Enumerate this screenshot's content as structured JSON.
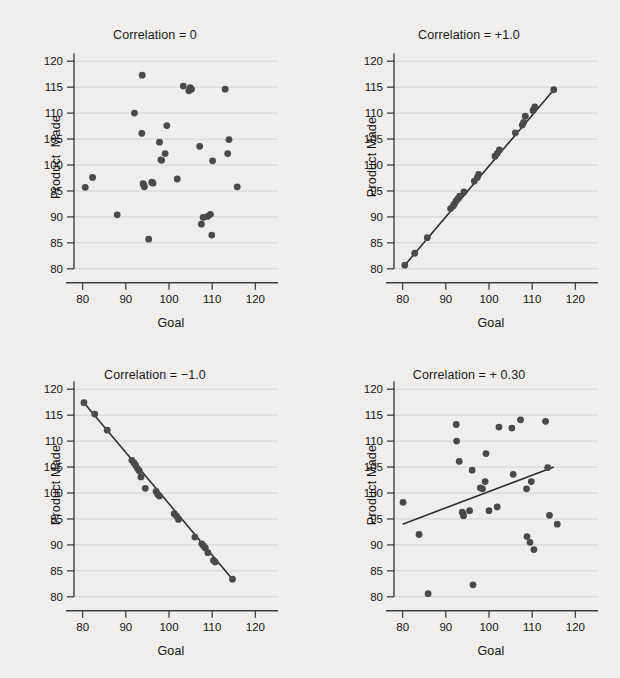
{
  "figure": {
    "background_color": "#efeeec",
    "point_color": "#4a4a4a",
    "line_color": "#2e2e2e",
    "grid_color": "#d2d2d2",
    "axis_color": "#3e3e3e"
  },
  "chart_data": [
    {
      "type": "scatter",
      "title": "Correlation = 0",
      "xlabel": "Goal",
      "ylabel": "Product  Made",
      "xlim": [
        78,
        122
      ],
      "ylim": [
        79,
        121
      ],
      "xticks": [
        80,
        90,
        100,
        110,
        120
      ],
      "yticks": [
        80,
        85,
        90,
        95,
        100,
        105,
        110,
        115,
        120
      ],
      "grid": true,
      "legend": "none",
      "fit_line": null,
      "x": [
        80.6,
        82.3,
        88.0,
        92.0,
        93.7,
        93.8,
        94.0,
        94.2,
        94.3,
        95.3,
        96.0,
        96.3,
        97.8,
        98.1,
        98.3,
        99.1,
        99.5,
        101.9,
        103.3,
        104.6,
        104.9,
        105.2,
        107.1,
        107.5,
        107.9,
        108.9,
        109.6,
        109.9,
        110.1,
        113.0,
        113.6,
        113.9,
        115.8
      ],
      "y": [
        95.7,
        97.6,
        90.4,
        110.0,
        106.1,
        117.3,
        96.4,
        96.1,
        95.8,
        85.7,
        96.7,
        96.5,
        104.4,
        101.0,
        100.9,
        102.2,
        107.6,
        97.3,
        115.2,
        114.3,
        114.9,
        114.6,
        103.6,
        88.6,
        89.9,
        90.1,
        90.5,
        86.5,
        100.8,
        114.6,
        102.2,
        104.9,
        95.8,
        94.0
      ]
    },
    {
      "type": "scatter",
      "title": "Correlation = +1.0",
      "xlabel": "Goal",
      "ylabel": "Product Made",
      "xlim": [
        78,
        122
      ],
      "ylim": [
        79,
        121
      ],
      "xticks": [
        80,
        90,
        100,
        110,
        120
      ],
      "yticks": [
        80,
        85,
        90,
        95,
        100,
        105,
        110,
        115,
        120
      ],
      "grid": true,
      "legend": "none",
      "fit_line": {
        "x": [
          80.5,
          115.0
        ],
        "y": [
          80.7,
          114.5
        ]
      },
      "x": [
        80.5,
        82.8,
        85.7,
        91.1,
        91.7,
        92.0,
        92.4,
        92.8,
        93.2,
        94.2,
        96.6,
        97.3,
        97.6,
        101.4,
        101.9,
        102.4,
        106.1,
        107.7,
        108.0,
        108.4,
        110.2,
        110.6,
        115.0
      ],
      "y": [
        80.7,
        83.0,
        86.0,
        91.6,
        92.1,
        92.5,
        93.1,
        93.5,
        94.0,
        94.8,
        96.9,
        97.6,
        98.2,
        101.7,
        102.2,
        102.9,
        106.2,
        107.7,
        108.2,
        109.4,
        110.5,
        111.2,
        114.5
      ]
    },
    {
      "type": "scatter",
      "title": "Correlation = −1.0",
      "xlabel": "Goal",
      "ylabel": "Product Made",
      "xlim": [
        78,
        122
      ],
      "ylim": [
        79,
        121
      ],
      "xticks": [
        80,
        90,
        100,
        110,
        120
      ],
      "yticks": [
        80,
        85,
        90,
        95,
        100,
        105,
        110,
        115,
        120
      ],
      "grid": true,
      "legend": "none",
      "fit_line": {
        "x": [
          80.3,
          114.7
        ],
        "y": [
          117.4,
          83.4
        ]
      },
      "x": [
        80.3,
        82.8,
        85.7,
        91.4,
        91.9,
        92.3,
        92.7,
        93.1,
        93.5,
        94.5,
        97.0,
        97.4,
        97.8,
        101.2,
        101.8,
        102.2,
        106.0,
        107.6,
        108.0,
        108.4,
        109.0,
        110.3,
        110.7,
        114.7
      ],
      "y": [
        117.4,
        115.2,
        112.1,
        106.3,
        105.8,
        105.3,
        104.7,
        104.3,
        103.1,
        100.9,
        100.3,
        99.7,
        99.4,
        96.0,
        95.5,
        94.9,
        91.5,
        90.2,
        89.8,
        89.4,
        88.5,
        87.0,
        86.7,
        83.4
      ]
    },
    {
      "type": "scatter",
      "title": "Correlation = + 0.30",
      "xlabel": "Goal",
      "ylabel": "Product Made",
      "xlim": [
        78,
        122
      ],
      "ylim": [
        79,
        121
      ],
      "xticks": [
        80,
        90,
        100,
        110,
        120
      ],
      "yticks": [
        80,
        85,
        90,
        95,
        100,
        105,
        110,
        115,
        120
      ],
      "grid": true,
      "legend": "none",
      "fit_line": {
        "x": [
          80.0,
          115.0
        ],
        "y": [
          94.0,
          105.0
        ]
      },
      "x": [
        80.1,
        83.8,
        85.9,
        92.4,
        92.5,
        93.1,
        93.8,
        94.0,
        94.1,
        95.5,
        96.1,
        96.3,
        98.0,
        98.5,
        99.1,
        99.3,
        100.0,
        101.9,
        102.3,
        105.3,
        105.6,
        107.3,
        108.7,
        108.8,
        109.5,
        109.8,
        110.4,
        113.1,
        113.6,
        114.0,
        115.8
      ],
      "y": [
        98.2,
        92.0,
        80.6,
        113.2,
        110.0,
        106.1,
        96.3,
        96.0,
        95.6,
        96.6,
        104.4,
        82.3,
        101.0,
        100.8,
        102.2,
        107.6,
        96.6,
        97.3,
        112.7,
        112.5,
        103.6,
        114.1,
        100.8,
        91.6,
        90.5,
        102.2,
        89.1,
        113.8,
        104.9,
        95.7,
        94.0
      ]
    }
  ]
}
